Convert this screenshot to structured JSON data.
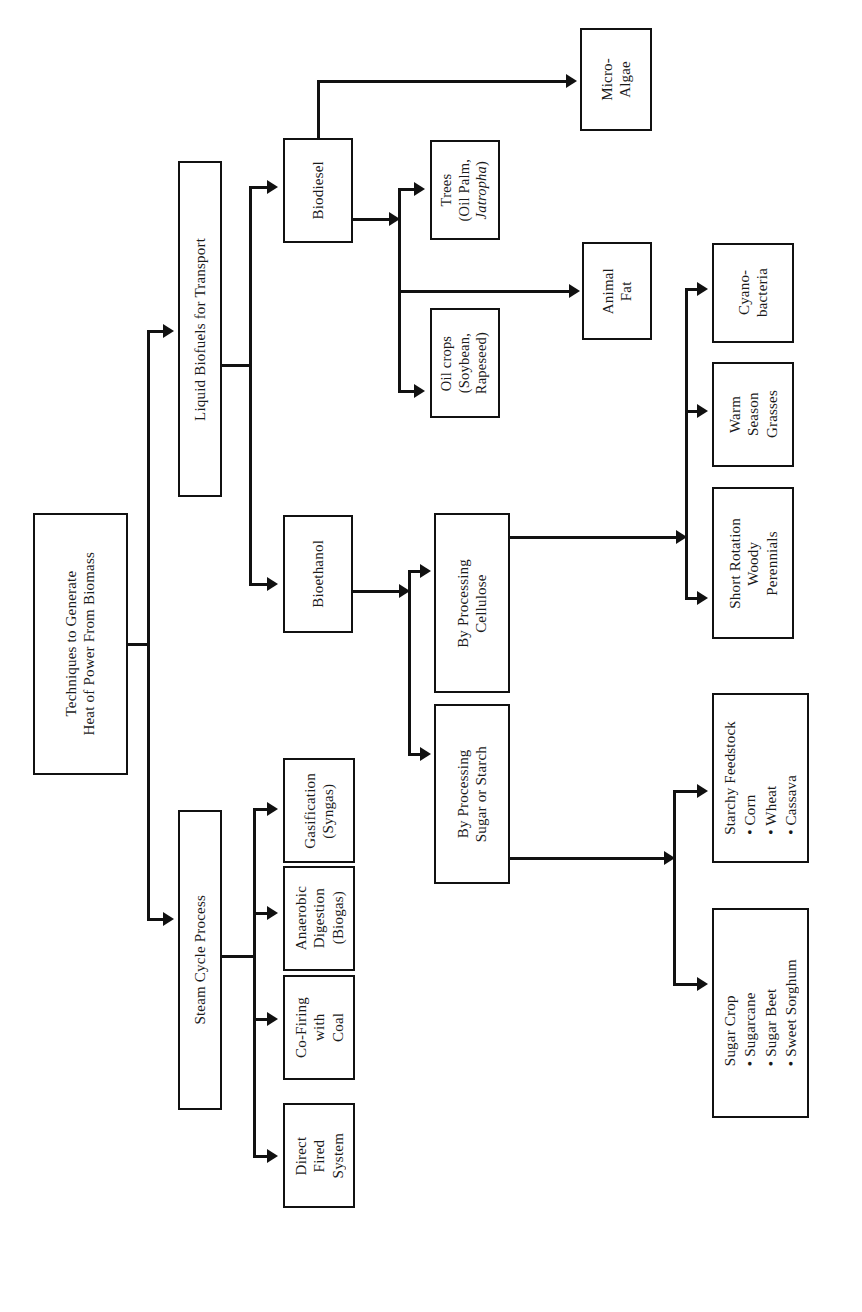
{
  "diagram": {
    "title": "Techniques to Generate Heat of Power From Biomass",
    "orientation": "rotated-90-clockwise",
    "nodes": {
      "root": "Techniques to Generate\nHeat of Power From Biomass",
      "liquid_biofuels": "Liquid Biofuels for Transport",
      "steam_cycle": "Steam Cycle Process",
      "biodiesel": "Biodiesel",
      "bioethanol": "Bioethanol",
      "micro_algae": "Micro-\nAlgae",
      "trees": "Trees\n(Oil Palm,",
      "trees_italic": "Jatropha",
      "trees_close": ")",
      "animal_fat": "Animal\nFat",
      "oil_crops": "Oil crops\n(Soybean,\nRapeseed)",
      "by_cellulose": "By Processing\nCellulose",
      "by_sugar_starch": "By Processing\nSugar or Starch",
      "cyanobacteria": "Cyano-\nbacteria",
      "warm_season_grasses": "Warm\nSeason\nGrasses",
      "short_rotation": "Short Rotation\nWoody\nPerennials",
      "starchy_feedstock": "Starchy Feedstock\n • Corn\n • Wheat\n • Cassava",
      "sugar_crop": "Sugar Crop\n • Sugarcane\n • Sugar Beet\n • Sweet Sorghum",
      "gasification": "Gasification\n(Syngas)",
      "anaerobic_digestion": "Anaerobic\nDigestion\n(Biogas)",
      "co_firing": "Co-Firing\nwith\nCoal",
      "direct_fired": "Direct\nFired\nSystem"
    },
    "edges": [
      {
        "from": "root",
        "to": "liquid_biofuels"
      },
      {
        "from": "root",
        "to": "steam_cycle"
      },
      {
        "from": "liquid_biofuels",
        "to": "biodiesel"
      },
      {
        "from": "liquid_biofuels",
        "to": "bioethanol"
      },
      {
        "from": "biodiesel",
        "to": "micro_algae"
      },
      {
        "from": "biodiesel",
        "to": "trees"
      },
      {
        "from": "biodiesel",
        "to": "animal_fat"
      },
      {
        "from": "biodiesel",
        "to": "oil_crops"
      },
      {
        "from": "bioethanol",
        "to": "by_cellulose"
      },
      {
        "from": "bioethanol",
        "to": "by_sugar_starch"
      },
      {
        "from": "by_cellulose",
        "to": "cyanobacteria"
      },
      {
        "from": "by_cellulose",
        "to": "warm_season_grasses"
      },
      {
        "from": "by_cellulose",
        "to": "short_rotation"
      },
      {
        "from": "by_sugar_starch",
        "to": "starchy_feedstock"
      },
      {
        "from": "by_sugar_starch",
        "to": "sugar_crop"
      },
      {
        "from": "steam_cycle",
        "to": "gasification"
      },
      {
        "from": "steam_cycle",
        "to": "anaerobic_digestion"
      },
      {
        "from": "steam_cycle",
        "to": "co_firing"
      },
      {
        "from": "steam_cycle",
        "to": "direct_fired"
      }
    ],
    "colors": {
      "stroke": "#111111",
      "fill": "#ffffff",
      "text": "#1a1a1a"
    }
  }
}
